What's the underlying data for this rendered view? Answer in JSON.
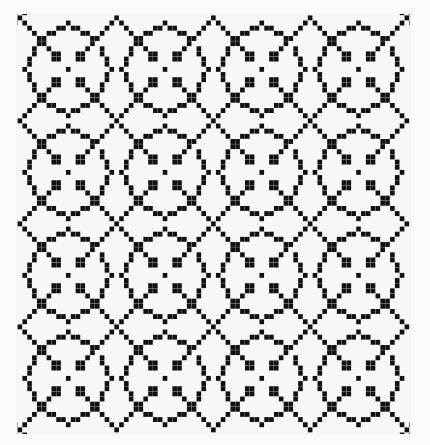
{
  "image": {
    "subject": "Black and white pixel-pattern quilt",
    "description": "A 4x4 grid of repeated motifs: stepped circular rings with a four-square center, joined by diagonal lattice lines that cross in small X shapes at block corners.",
    "colors": {
      "background": "#fbfbfb",
      "fabric": "#f7f7f7",
      "pattern": "#111111"
    },
    "blocks": {
      "rows": 4,
      "cols": 4
    },
    "motif": {
      "tile_cells": 20,
      "ring": [
        [
          8,
          2
        ],
        [
          9,
          2
        ],
        [
          11,
          2
        ],
        [
          12,
          2
        ],
        [
          10,
          1
        ],
        [
          6,
          3
        ],
        [
          7,
          3
        ],
        [
          13,
          3
        ],
        [
          14,
          3
        ],
        [
          5,
          4
        ],
        [
          15,
          4
        ],
        [
          4,
          5
        ],
        [
          16,
          4
        ],
        [
          3,
          6
        ],
        [
          17,
          6
        ],
        [
          3,
          7
        ],
        [
          17,
          7
        ],
        [
          2,
          8
        ],
        [
          18,
          8
        ],
        [
          2,
          9
        ],
        [
          18,
          9
        ],
        [
          1,
          10
        ],
        [
          19,
          10
        ],
        [
          2,
          11
        ],
        [
          18,
          11
        ],
        [
          2,
          12
        ],
        [
          18,
          12
        ],
        [
          3,
          13
        ],
        [
          17,
          13
        ],
        [
          3,
          14
        ],
        [
          17,
          14
        ],
        [
          4,
          15
        ],
        [
          16,
          15
        ],
        [
          5,
          16
        ],
        [
          15,
          16
        ],
        [
          6,
          17
        ],
        [
          7,
          17
        ],
        [
          13,
          17
        ],
        [
          14,
          17
        ],
        [
          8,
          18
        ],
        [
          9,
          18
        ],
        [
          11,
          18
        ],
        [
          12,
          18
        ],
        [
          10,
          19
        ]
      ],
      "center": [
        [
          7,
          7
        ],
        [
          8,
          7
        ],
        [
          7,
          8
        ],
        [
          8,
          8
        ],
        [
          12,
          7
        ],
        [
          13,
          7
        ],
        [
          12,
          8
        ],
        [
          13,
          8
        ],
        [
          7,
          12
        ],
        [
          8,
          12
        ],
        [
          7,
          13
        ],
        [
          8,
          13
        ],
        [
          12,
          12
        ],
        [
          13,
          12
        ],
        [
          12,
          13
        ],
        [
          13,
          13
        ],
        [
          10,
          10
        ]
      ],
      "diagonals": true
    }
  }
}
